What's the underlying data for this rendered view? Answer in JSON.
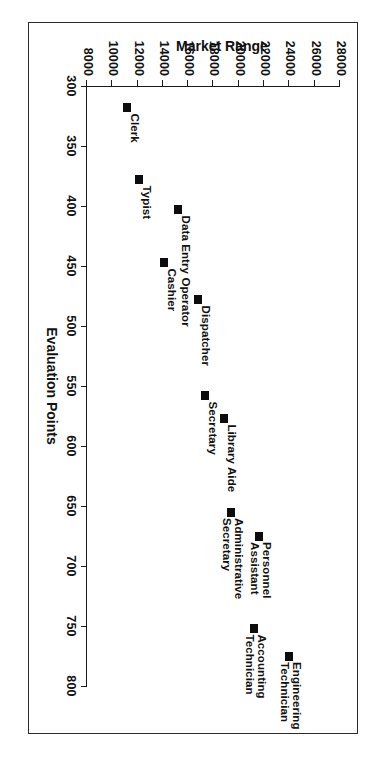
{
  "chart_data": {
    "type": "scatter",
    "title": "",
    "xlabel": "Evaluation Points",
    "ylabel": "Market Range",
    "xlim": [
      300,
      800
    ],
    "ylim": [
      8000,
      28000
    ],
    "grid": false,
    "legend": "none",
    "x_ticks": [
      300,
      350,
      400,
      450,
      500,
      550,
      600,
      650,
      700,
      750,
      800
    ],
    "y_ticks": [
      8000,
      10000,
      12000,
      14000,
      16000,
      18000,
      20000,
      22000,
      24000,
      26000,
      28000
    ],
    "x_tick_labels": [
      "300",
      "350",
      "400",
      "450",
      "500",
      "550",
      "600",
      "650",
      "700",
      "750",
      "800"
    ],
    "y_tick_labels": [
      "8000",
      "10000",
      "12000",
      "14000",
      "16000",
      "18000",
      "20000",
      "22000",
      "24000",
      "26000",
      "28000"
    ],
    "points": [
      {
        "label": "Clerk",
        "x": 318,
        "y": 11200,
        "label_pos": "above-right"
      },
      {
        "label": "Typist",
        "x": 378,
        "y": 12100,
        "label_pos": "above-right"
      },
      {
        "label": "Data Entry Operator",
        "x": 403,
        "y": 15200,
        "label_pos": "above-right"
      },
      {
        "label": "Cashier",
        "x": 447,
        "y": 14100,
        "label_pos": "above-right"
      },
      {
        "label": "Dispatcher",
        "x": 478,
        "y": 16800,
        "label_pos": "above-right"
      },
      {
        "label": "Secretary",
        "x": 558,
        "y": 17300,
        "label_pos": "above-right"
      },
      {
        "label": "Library Aide",
        "x": 577,
        "y": 18800,
        "label_pos": "above-right"
      },
      {
        "label": "Administrative Secretary",
        "x": 655,
        "y": 19400,
        "label_pos": "above-right"
      },
      {
        "label": "Personnel Assistant",
        "x": 675,
        "y": 21600,
        "label_pos": "above-right"
      },
      {
        "label": "Accounting Technician",
        "x": 752,
        "y": 21200,
        "label_pos": "above-right"
      },
      {
        "label": "Engineering Technician",
        "x": 775,
        "y": 24000,
        "label_pos": "above-right"
      }
    ]
  },
  "colors": {
    "marker": "#0d0d0d",
    "axis": "#1a1a1a",
    "frame": "#2a2a2a",
    "background": "#ffffff"
  }
}
